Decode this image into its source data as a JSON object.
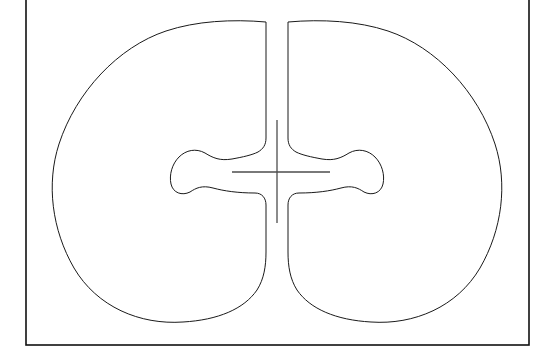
{
  "document": {
    "kind": "technical-line-drawing",
    "background_color": "#ffffff",
    "line_color": "#1a1a1a",
    "frame_color": "#111111",
    "crosshair_color": "#4d4d4d",
    "title_text": "",
    "labels": []
  },
  "chart_data": {
    "type": "line",
    "title": "",
    "xlabel": "",
    "ylabel": "",
    "grid": false,
    "legend": null,
    "annotations": []
  },
  "frame": {
    "name": "drawing-border",
    "x": 26,
    "y": -8,
    "width": 503,
    "height": 353,
    "left": 26,
    "right": 529,
    "bottom": 345,
    "top_clipped": true
  },
  "geometry": {
    "symmetry_axis_x": 277,
    "center_y": 172,
    "lobe_top_y": 20,
    "lobe_bottom_y": 322,
    "left_lobe": {
      "name": "left-lobe",
      "leftmost_x": 52,
      "apex_x": 180,
      "bulb_center_x": 192,
      "bulb_leftmost_x": 170,
      "bulb_top_y": 150,
      "bulb_bottom_y": 193,
      "cleft_edge_x": 266
    },
    "right_lobe": {
      "name": "right-lobe",
      "rightmost_x": 505,
      "apex_x": 375,
      "bulb_center_x": 362,
      "bulb_rightmost_x": 384,
      "bulb_top_y": 150,
      "bulb_bottom_y": 193,
      "cleft_edge_x": 289
    },
    "crosshair": {
      "name": "center-crosshair",
      "center_x": 277,
      "center_y": 172,
      "horizontal_x1": 232,
      "horizontal_x2": 330,
      "vertical_y1": 120,
      "vertical_y2": 223
    }
  },
  "paths": {
    "left_lobe_d": "M 266 22 C 232 19 196 21 166 31 C 118 47 76 92 59 144 C 46 184 52 230 74 268 C 97 307 140 325 183 322 C 218 320 244 309 257 290 C 264 279 266 266 266 252 L 266 205 C 266 198 262 193 255 193 C 238 193 224 191 213 188 C 202 185 196 188 190 192 C 182 196 173 193 171 184 C 169 175 172 164 179 157 C 186 150 196 148 205 153 C 213 158 220 161 232 159 C 243 157 252 155 258 152 C 263 149 266 145 266 138 L 266 22 Z",
    "right_lobe_d": "M 288 22 C 322 19 358 21 388 31 C 436 47 478 92 495 144 C 508 184 502 230 480 268 C 457 307 414 325 371 322 C 336 320 310 309 297 290 C 290 279 288 266 288 252 L 288 205 C 288 198 292 193 299 193 C 316 193 330 191 341 188 C 352 185 358 188 364 192 C 372 196 381 193 383 184 C 385 175 382 164 375 157 C 368 150 358 148 349 153 C 341 158 334 161 322 159 C 311 157 302 155 296 152 C 291 149 288 145 288 138 L 288 22 Z"
  }
}
